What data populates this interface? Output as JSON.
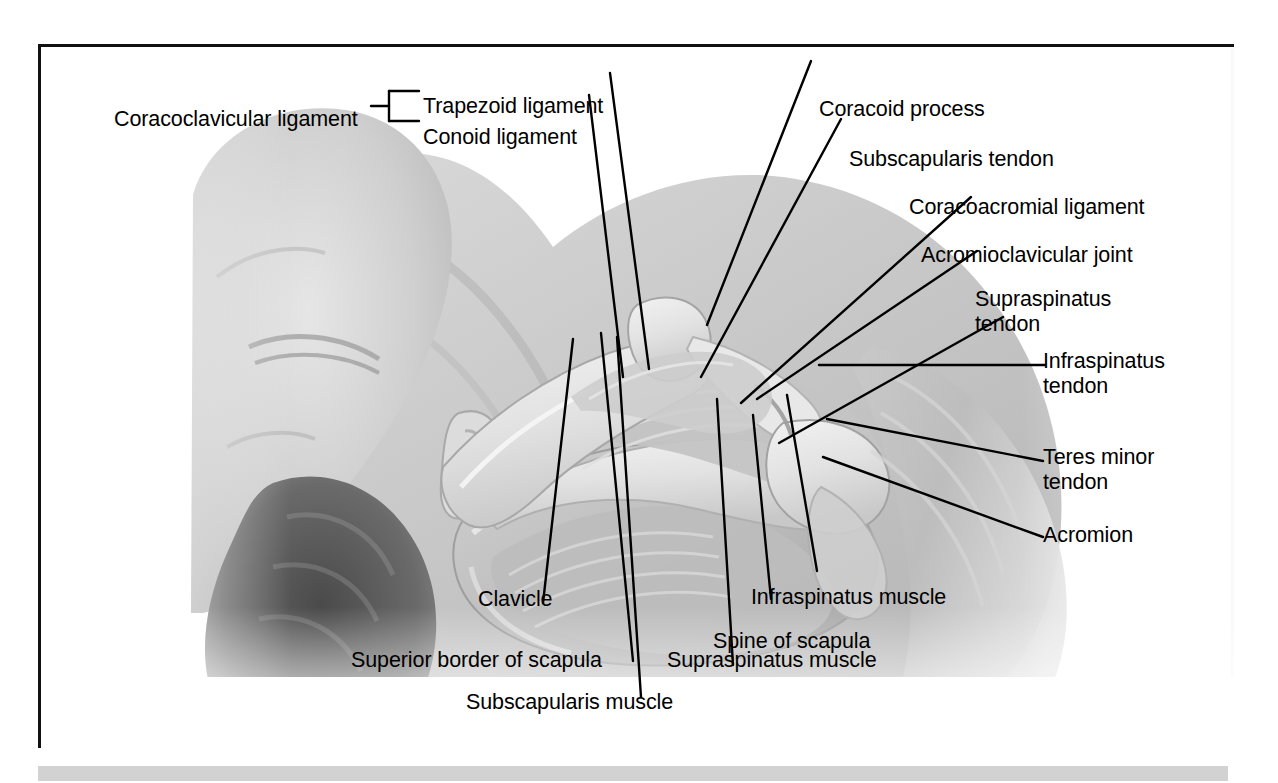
{
  "figure": {
    "frame_color": "#111111",
    "background_color": "#ffffff",
    "bottom_bar_color": "#d2d2d2"
  },
  "bracket_group": {
    "group_label": "Coracoclavicular ligament",
    "members": [
      {
        "label": "Trapezoid ligament"
      },
      {
        "label": "Conoid ligament"
      }
    ]
  },
  "labels": {
    "coracoid_process": "Coracoid process",
    "subscapularis_tendon": "Subscapularis tendon",
    "coracoacromial_ligament": "Coracoacromial ligament",
    "acromioclavicular_joint": "Acromioclavicular joint",
    "supraspinatus_tendon": "Supraspinatus\ntendon",
    "infraspinatus_tendon": "Infraspinatus\ntendon",
    "teres_minor_tendon": "Teres minor\ntendon",
    "acromion": "Acromion",
    "clavicle": "Clavicle",
    "infraspinatus_muscle": "Infraspinatus muscle",
    "spine_of_scapula": "Spine of scapula",
    "superior_border_of_scapula": "Superior border of scapula",
    "supraspinatus_muscle": "Supraspinatus muscle",
    "subscapularis_muscle": "Subscapularis muscle"
  },
  "structures_depicted": [
    "head",
    "ear",
    "hair",
    "neck",
    "trapezius",
    "clavicle",
    "scapula",
    "acromion",
    "coracoid process",
    "supraspinatus muscle",
    "infraspinatus muscle",
    "subscapularis muscle",
    "rotator cuff tendons",
    "deltoid / upper arm"
  ]
}
